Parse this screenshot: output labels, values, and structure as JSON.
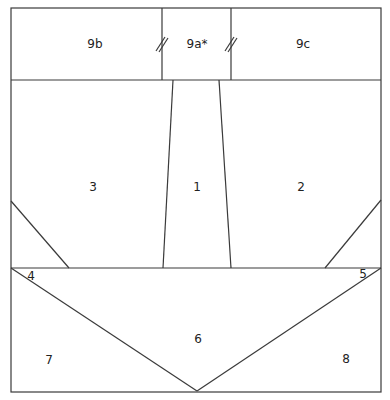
{
  "diagram": {
    "type": "paper-piecing-pattern",
    "colors": {
      "line": "#3a3a3a",
      "text": "#222222",
      "background": "#ffffff"
    },
    "pieces": [
      {
        "id": "9b",
        "label": "9b",
        "x": 95,
        "y": 44
      },
      {
        "id": "9a",
        "label": "9a*",
        "x": 197,
        "y": 44
      },
      {
        "id": "9c",
        "label": "9c",
        "x": 303,
        "y": 44
      },
      {
        "id": "3",
        "label": "3",
        "x": 93,
        "y": 187
      },
      {
        "id": "1",
        "label": "1",
        "x": 197,
        "y": 187
      },
      {
        "id": "2",
        "label": "2",
        "x": 301,
        "y": 187
      },
      {
        "id": "4",
        "label": "4",
        "x": 31,
        "y": 276
      },
      {
        "id": "5",
        "label": "5",
        "x": 363,
        "y": 274
      },
      {
        "id": "6",
        "label": "6",
        "x": 198,
        "y": 339
      },
      {
        "id": "7",
        "label": "7",
        "x": 49,
        "y": 360
      },
      {
        "id": "8",
        "label": "8",
        "x": 346,
        "y": 359
      }
    ],
    "seam_marks": [
      {
        "between": [
          "9b",
          "9a"
        ],
        "symbol": "double-slash"
      },
      {
        "between": [
          "9a",
          "9c"
        ],
        "symbol": "double-slash"
      }
    ]
  }
}
